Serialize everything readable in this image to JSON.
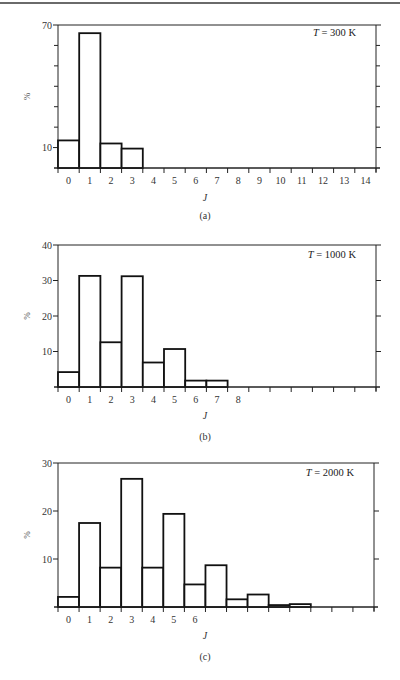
{
  "chart_data": [
    {
      "type": "bar",
      "panel_label": "(a)",
      "annotation_var": "T",
      "annotation_rest": " = 300 K",
      "title": "",
      "xlabel": "J",
      "ylabel": "%",
      "ylim": [
        0,
        70
      ],
      "ytick_labels": [
        {
          "value": 70,
          "label": "70"
        },
        {
          "value": 10,
          "label": "10"
        }
      ],
      "yticks_unlabeled": [
        20,
        30,
        40,
        50,
        60
      ],
      "categories": [
        "0",
        "1",
        "2",
        "3",
        "4",
        "5",
        "6",
        "7",
        "8",
        "9",
        "10",
        "11",
        "12",
        "13",
        "14"
      ],
      "xtick_labels": [
        "0",
        "1",
        "2",
        "3",
        "4",
        "5",
        "6",
        "7",
        "8",
        "9",
        "10",
        "11",
        "12",
        "13",
        "14"
      ],
      "values": [
        13.5,
        66,
        12,
        9.5,
        0,
        0,
        0,
        0,
        0,
        0,
        0,
        0,
        0,
        0,
        0
      ],
      "legend": "none",
      "grid": false
    },
    {
      "type": "bar",
      "panel_label": "(b)",
      "annotation_var": "T",
      "annotation_rest": " = 1000 K",
      "title": "",
      "xlabel": "J",
      "ylabel": "%",
      "ylim": [
        0,
        40
      ],
      "ytick_labels": [
        {
          "value": 40,
          "label": "40"
        },
        {
          "value": 30,
          "label": "30"
        },
        {
          "value": 20,
          "label": "20"
        },
        {
          "value": 10,
          "label": "10"
        }
      ],
      "yticks_unlabeled": [],
      "categories": [
        "0",
        "1",
        "2",
        "3",
        "4",
        "5",
        "6",
        "7",
        "8",
        "9",
        "10",
        "11",
        "12",
        "13",
        "14"
      ],
      "xtick_labels": [
        "0",
        "1",
        "2",
        "3",
        "4",
        "5",
        "6",
        "7",
        "8",
        "",
        "",
        "",
        "",
        "",
        ""
      ],
      "values": [
        4.2,
        31.3,
        12.6,
        31.2,
        6.9,
        10.7,
        1.8,
        1.8,
        0,
        0,
        0,
        0,
        0,
        0,
        0
      ],
      "legend": "none",
      "grid": false
    },
    {
      "type": "bar",
      "panel_label": "(c)",
      "annotation_var": "T",
      "annotation_rest": " = 2000 K",
      "title": "",
      "xlabel": "J",
      "ylabel": "%",
      "ylim": [
        0,
        30
      ],
      "ytick_labels": [
        {
          "value": 30,
          "label": "30"
        },
        {
          "value": 20,
          "label": "20"
        },
        {
          "value": 10,
          "label": "10"
        }
      ],
      "yticks_unlabeled": [],
      "categories": [
        "0",
        "1",
        "2",
        "3",
        "4",
        "5",
        "6",
        "7",
        "8",
        "9",
        "10",
        "11",
        "12",
        "13",
        "14"
      ],
      "xtick_labels": [
        "0",
        "1",
        "2",
        "3",
        "4",
        "5",
        "6",
        "",
        "",
        "",
        "",
        "",
        "",
        "",
        ""
      ],
      "values": [
        2.1,
        17.5,
        8.2,
        26.7,
        8.2,
        19.4,
        4.7,
        8.7,
        1.6,
        2.6,
        0.4,
        0.6,
        0,
        0,
        0
      ],
      "legend": "none",
      "grid": false
    }
  ]
}
